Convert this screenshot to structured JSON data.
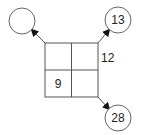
{
  "diagram": {
    "grid": {
      "cells": [
        {
          "row": 0,
          "col": 0,
          "value": ""
        },
        {
          "row": 0,
          "col": 1,
          "value": ""
        },
        {
          "row": 1,
          "col": 0,
          "value": "9"
        },
        {
          "row": 1,
          "col": 1,
          "value": ""
        }
      ],
      "side_label": "12"
    },
    "circles": [
      {
        "position": "top-left",
        "value": ""
      },
      {
        "position": "top-right",
        "value": "13"
      },
      {
        "position": "bottom-right",
        "value": "28"
      }
    ]
  }
}
